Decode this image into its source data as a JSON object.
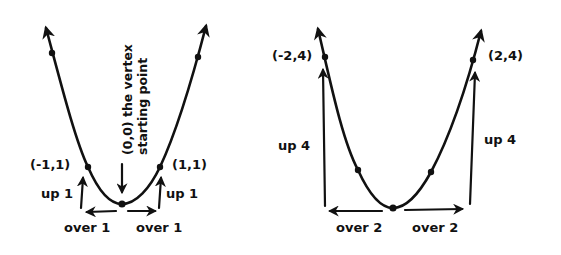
{
  "diagram": {
    "left_graph": {
      "vertex_label_line1": "(0,0) the vertex",
      "vertex_label_line2": "starting point",
      "point_left_label": "(-1,1)",
      "point_right_label": "(1,1)",
      "up_left_label": "up 1",
      "up_right_label": "up 1",
      "over_left_label": "over 1",
      "over_right_label": "over 1"
    },
    "right_graph": {
      "point_left_label": "(-2,4)",
      "point_right_label": "(2,4)",
      "up_left_label": "up 4",
      "up_right_label": "up 4",
      "over_left_label": "over 2",
      "over_right_label": "over 2"
    },
    "colors": {
      "ink": "#111111",
      "background": "#ffffff"
    }
  }
}
